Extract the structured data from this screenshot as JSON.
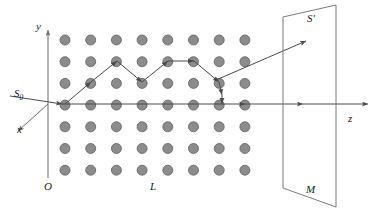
{
  "figure": {
    "labels": {
      "y_axis": "y",
      "x_axis": "x",
      "z_axis": "z",
      "origin": "O",
      "incident_beam": "S",
      "incident_beam_sub": "0",
      "lattice": "L",
      "scattered_beam": "S'",
      "screen": "M"
    },
    "colors": {
      "atom_fill": "#8c8c8c",
      "atom_stroke": "#5e5e5e",
      "axis": "#6b6b6b",
      "ray": "#4a4a4a",
      "screen": "#7a7a7a",
      "background": "#ffffff",
      "text": "#1a1a1a"
    },
    "lattice": {
      "columns": 8,
      "rows": 7,
      "col_spacing": 25.7,
      "row_spacing": 21.7,
      "x_start": 65,
      "y_start": 40,
      "atom_radius": 5.0
    },
    "axes": {
      "origin": [
        48,
        104
      ],
      "y_axis_top": [
        48,
        30
      ],
      "y_axis_bottom": [
        48,
        178
      ],
      "x_axis_end": [
        18,
        131
      ],
      "z_axis_end": [
        368,
        104
      ]
    },
    "incident_ray": {
      "from": [
        10,
        96
      ],
      "to": [
        62,
        104
      ]
    },
    "zigzag_path": [
      [
        65,
        104
      ],
      [
        91,
        82
      ],
      [
        117,
        61
      ],
      [
        142,
        82
      ],
      [
        168,
        61
      ],
      [
        194,
        61
      ],
      [
        219,
        82
      ],
      [
        222,
        95
      ],
      [
        222,
        104
      ]
    ],
    "scatter_ray": {
      "from": [
        216,
        80
      ],
      "to": [
        306,
        41
      ]
    },
    "through_beam_arrows": [
      [
        62,
        104,
        245,
        104
      ],
      [
        245,
        104,
        303,
        104
      ],
      [
        303,
        104,
        368,
        104
      ]
    ],
    "screen_polygon": [
      [
        283,
        17
      ],
      [
        336,
        5
      ],
      [
        336,
        207
      ],
      [
        283,
        188
      ]
    ],
    "label_positions": {
      "y": [
        36,
        30
      ],
      "x": [
        17,
        133
      ],
      "z": [
        348,
        122
      ],
      "O": [
        44,
        190
      ],
      "S0": [
        14,
        97
      ],
      "L": [
        150,
        190
      ],
      "S_prime": [
        307,
        22
      ],
      "M": [
        306,
        193
      ]
    }
  }
}
